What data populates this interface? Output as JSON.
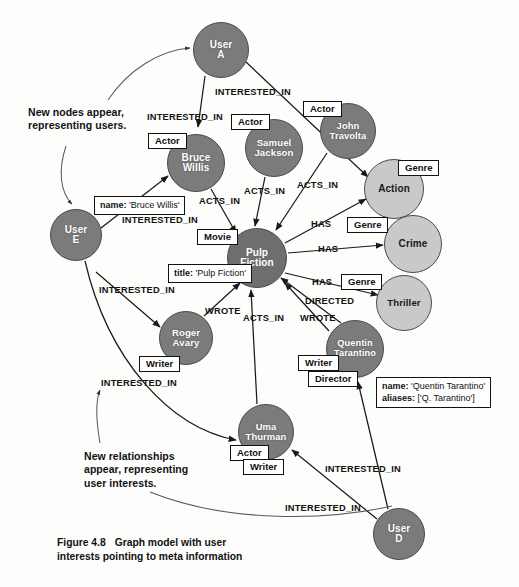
{
  "figure": {
    "number": "Figure 4.8",
    "title": "Graph model with user",
    "title_line2": "interests pointing to meta information"
  },
  "annotations": [
    {
      "id": "new-nodes",
      "line1": "New nodes appear,",
      "line2": "representing users."
    },
    {
      "id": "new-rels",
      "line1": "New relationships",
      "line2": "appear, representing",
      "line3": "user interests."
    }
  ],
  "nodes": [
    {
      "id": "user-a",
      "label_line1": "User",
      "label_line2": "A",
      "kind": "user",
      "shade": "dark",
      "cx": 221,
      "cy": 50,
      "r": 28
    },
    {
      "id": "user-e",
      "label_line1": "User",
      "label_line2": "E",
      "kind": "user",
      "shade": "dark",
      "cx": 76,
      "cy": 235,
      "r": 26
    },
    {
      "id": "user-d",
      "label_line1": "User",
      "label_line2": "D",
      "kind": "user",
      "shade": "dark",
      "cx": 399,
      "cy": 534,
      "r": 26
    },
    {
      "id": "bruce-willis",
      "label_line1": "Bruce",
      "label_line2": "Willis",
      "kind": "person",
      "shade": "dark",
      "cx": 196,
      "cy": 163,
      "r": 29
    },
    {
      "id": "samuel-jackson",
      "label_line1": "Samuel",
      "label_line2": "Jackson",
      "kind": "person",
      "shade": "dark",
      "cx": 274,
      "cy": 148,
      "r": 29
    },
    {
      "id": "john-travolta",
      "label_line1": "John",
      "label_line2": "Travolta",
      "kind": "person",
      "shade": "dark",
      "cx": 348,
      "cy": 131,
      "r": 28
    },
    {
      "id": "pulp-fiction",
      "label_line1": "Pulp",
      "label_line2": "Fiction",
      "kind": "movie",
      "shade": "darker",
      "cx": 257,
      "cy": 258,
      "r": 30
    },
    {
      "id": "roger-avary",
      "label_line1": "Roger",
      "label_line2": "Avary",
      "kind": "person",
      "shade": "dark",
      "cx": 186,
      "cy": 338,
      "r": 27
    },
    {
      "id": "quentin-tarantino",
      "label_line1": "Quentin",
      "label_line2": "Tarantino",
      "kind": "person",
      "shade": "dark",
      "cx": 355,
      "cy": 349,
      "r": 29
    },
    {
      "id": "uma-thurman",
      "label_line1": "Uma",
      "label_line2": "Thurman",
      "kind": "person",
      "shade": "dark",
      "cx": 266,
      "cy": 432,
      "r": 28
    },
    {
      "id": "action",
      "label_line1": "Action",
      "label_line2": "",
      "kind": "genre",
      "shade": "light",
      "cx": 394,
      "cy": 189,
      "r": 30
    },
    {
      "id": "crime",
      "label_line1": "Crime",
      "label_line2": "",
      "kind": "genre",
      "shade": "light",
      "cx": 413,
      "cy": 244,
      "r": 29
    },
    {
      "id": "thriller",
      "label_line1": "Thriller",
      "label_line2": "",
      "kind": "genre",
      "shade": "light",
      "cx": 404,
      "cy": 303,
      "r": 28
    }
  ],
  "chips": [
    {
      "id": "chip-actor-bruce",
      "text": "Actor",
      "x": 148,
      "y": 133
    },
    {
      "id": "chip-actor-samuel",
      "text": "Actor",
      "x": 231,
      "y": 114
    },
    {
      "id": "chip-actor-travolta",
      "text": "Actor",
      "x": 303,
      "y": 101
    },
    {
      "id": "chip-genre-action",
      "text": "Genre",
      "x": 398,
      "y": 160
    },
    {
      "id": "chip-genre-crime",
      "text": "Genre",
      "x": 347,
      "y": 217
    },
    {
      "id": "chip-genre-thriller",
      "text": "Genre",
      "x": 341,
      "y": 274
    },
    {
      "id": "chip-movie",
      "text": "Movie",
      "x": 197,
      "y": 229
    },
    {
      "id": "chip-writer-roger",
      "text": "Writer",
      "x": 139,
      "y": 356
    },
    {
      "id": "chip-writer-qt",
      "text": "Writer",
      "x": 298,
      "y": 355
    },
    {
      "id": "chip-director-qt",
      "text": "Director",
      "x": 308,
      "y": 371
    },
    {
      "id": "chip-actor-uma",
      "text": "Actor",
      "x": 230,
      "y": 445
    },
    {
      "id": "chip-writer-uma",
      "text": "Writer",
      "x": 243,
      "y": 459
    }
  ],
  "properties": [
    {
      "id": "prop-bruce-willis",
      "x": 94,
      "y": 196,
      "rows": [
        {
          "key": "name:",
          "value": " 'Bruce Willis'"
        }
      ]
    },
    {
      "id": "prop-pulp-fiction",
      "x": 168,
      "y": 264,
      "rows": [
        {
          "key": "title:",
          "value": " 'Pulp Fiction'"
        }
      ]
    },
    {
      "id": "prop-quentin-tarantino",
      "x": 376,
      "y": 377,
      "rows": [
        {
          "key": "name:",
          "value": " 'Quentin Tarantino'"
        },
        {
          "key": "aliases:",
          "value": " ['Q. Tarantino']"
        }
      ]
    }
  ],
  "edge_labels": [
    {
      "id": "el-a-bruce",
      "text": "INTERESTED_IN",
      "x": 147,
      "y": 112
    },
    {
      "id": "el-a-action",
      "text": "INTERESTED_IN",
      "x": 215,
      "y": 87
    },
    {
      "id": "el-bruce-pulp",
      "text": "ACTS_IN",
      "x": 199,
      "y": 196
    },
    {
      "id": "el-samuel-pulp",
      "text": "ACTS_IN",
      "x": 244,
      "y": 186
    },
    {
      "id": "el-travolta-pulp",
      "text": "ACTS_IN",
      "x": 297,
      "y": 180
    },
    {
      "id": "el-e-bruce",
      "text": "INTERESTED_IN",
      "x": 122,
      "y": 215
    },
    {
      "id": "el-has-action",
      "text": "HAS",
      "x": 311,
      "y": 219
    },
    {
      "id": "el-has-crime",
      "text": "HAS",
      "x": 318,
      "y": 244
    },
    {
      "id": "el-has-thriller",
      "text": "HAS",
      "x": 312,
      "y": 277
    },
    {
      "id": "el-directed",
      "text": "DIRECTED",
      "x": 305,
      "y": 296
    },
    {
      "id": "el-wrote-qt",
      "text": "WROTE",
      "x": 300,
      "y": 313
    },
    {
      "id": "el-wrote-roger",
      "text": "WROTE",
      "x": 205,
      "y": 306
    },
    {
      "id": "el-e-roger",
      "text": "INTERESTED_IN",
      "x": 99,
      "y": 285
    },
    {
      "id": "el-e-uma",
      "text": "INTERESTED_IN",
      "x": 101,
      "y": 378
    },
    {
      "id": "el-uma-pulp",
      "text": "ACTS_IN",
      "x": 243,
      "y": 313
    },
    {
      "id": "el-d-qt",
      "text": "INTERESTED_IN",
      "x": 325,
      "y": 464
    },
    {
      "id": "el-d-uma",
      "text": "INTERESTED_IN",
      "x": 285,
      "y": 503
    }
  ],
  "colors": {
    "node_dark": "#7b7b7b",
    "node_darker": "#6e6e6e",
    "node_light": "#c9c9c9",
    "stroke": "#1a1a1a",
    "page": "#fdfdfb"
  }
}
